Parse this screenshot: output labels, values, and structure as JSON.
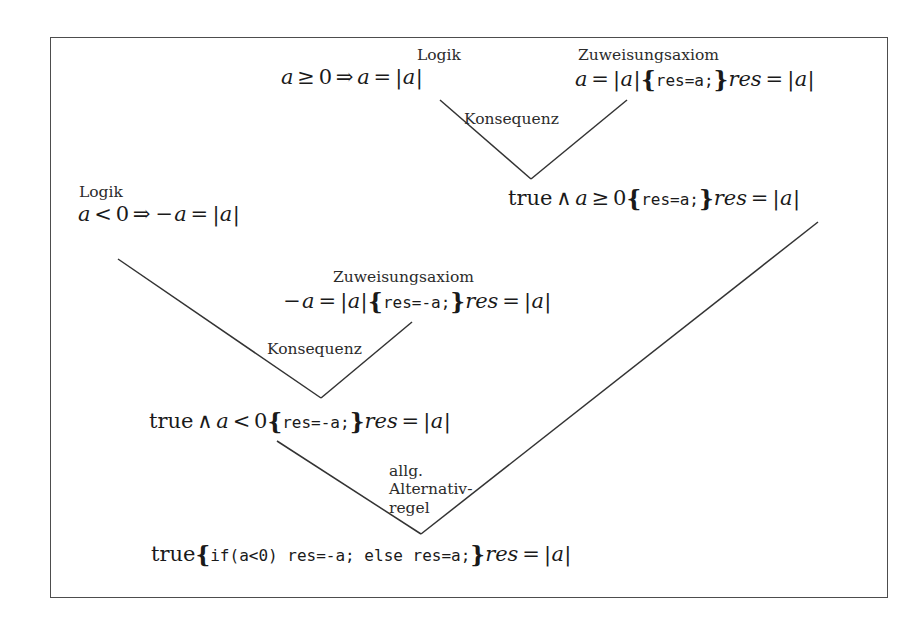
{
  "figure": {
    "type": "proof-tree",
    "language": "de",
    "border_color": "#4d4d4d",
    "text_color": "#1a1a1a",
    "line_color": "#333333"
  },
  "labels": {
    "logik_top": "Logik",
    "zuweisungsaxiom_top": "Zuweisungsaxiom",
    "konsequenz_top": "Konsequenz",
    "logik_left": "Logik",
    "zuweisungsaxiom_mid": "Zuweisungsaxiom",
    "konsequenz_mid": "Konsequenz",
    "alternativregel_line1": "allg.",
    "alternativregel_line2": "Alternativ-",
    "alternativregel_line3": "regel"
  },
  "nodes": {
    "premise_logic_pos": {
      "text": "a ≥ 0 ⇒ a = |a|",
      "var": "a",
      "rel": "≥",
      "zero": "0",
      "implies": "⇒",
      "eq": "=",
      "abs_open": "|",
      "abs_var": "a",
      "abs_close": "|"
    },
    "premise_assign_pos": {
      "text": "a = |a| {res=a;} res = |a|",
      "pre_var": "a",
      "pre_eq": "=",
      "pre_abs": "|a|",
      "program": "res=a;",
      "post_res": "res",
      "post_eq": "=",
      "post_abs": "|a|"
    },
    "conclusion_pos": {
      "text": "true ∧ a ≥ 0 {res=a;} res = |a|",
      "true_kw": "true",
      "and": "∧",
      "var": "a",
      "rel": "≥",
      "zero": "0",
      "program": "res=a;",
      "post_res": "res",
      "post_eq": "=",
      "post_abs": "|a|"
    },
    "premise_logic_neg": {
      "text": "a < 0 ⇒ −a = |a|",
      "var": "a",
      "rel": "<",
      "zero": "0",
      "implies": "⇒",
      "neg_var": "−a",
      "eq": "=",
      "post_abs": "|a|"
    },
    "premise_assign_neg": {
      "text": "−a = |a| {res=-a;} res = |a|",
      "pre_negvar": "−a",
      "pre_eq": "=",
      "pre_abs": "|a|",
      "program": "res=-a;",
      "post_res": "res",
      "post_eq": "=",
      "post_abs": "|a|"
    },
    "conclusion_neg": {
      "text": "true ∧ a < 0 {res=-a;} res = |a|",
      "true_kw": "true",
      "and": "∧",
      "var": "a",
      "rel": "<",
      "zero": "0",
      "program": "res=-a;",
      "post_res": "res",
      "post_eq": "=",
      "post_abs": "|a|"
    },
    "final_conclusion": {
      "text": "true {if(a<0) res=-a; else res=a;} res = |a|",
      "true_kw": "true",
      "program": "if(a<0) res=-a; else res=a;",
      "post_res": "res",
      "post_eq": "=",
      "post_abs": "|a|"
    }
  }
}
